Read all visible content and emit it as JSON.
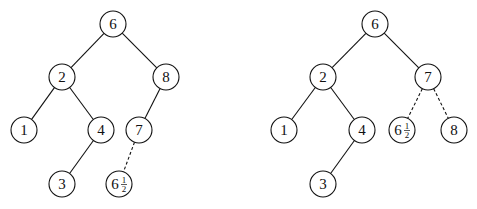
{
  "figure": {
    "trees": [
      {
        "id": "left-tree",
        "nodes": [
          {
            "id": "n6",
            "label": "6",
            "x": 113,
            "y": 24
          },
          {
            "id": "n2",
            "label": "2",
            "x": 62,
            "y": 77
          },
          {
            "id": "n8",
            "label": "8",
            "x": 166,
            "y": 77
          },
          {
            "id": "n1",
            "label": "1",
            "x": 24,
            "y": 130
          },
          {
            "id": "n4",
            "label": "4",
            "x": 101,
            "y": 130
          },
          {
            "id": "n7",
            "label": "7",
            "x": 139,
            "y": 130
          },
          {
            "id": "n3",
            "label": "3",
            "x": 62,
            "y": 184
          },
          {
            "id": "n6h",
            "label": "6",
            "fraction": {
              "num": "1",
              "den": "2"
            },
            "x": 119,
            "y": 184
          }
        ],
        "edges": [
          {
            "from": "n6",
            "to": "n2",
            "style": "solid"
          },
          {
            "from": "n6",
            "to": "n8",
            "style": "solid"
          },
          {
            "from": "n2",
            "to": "n1",
            "style": "solid"
          },
          {
            "from": "n2",
            "to": "n4",
            "style": "solid"
          },
          {
            "from": "n8",
            "to": "n7",
            "style": "solid"
          },
          {
            "from": "n4",
            "to": "n3",
            "style": "solid"
          },
          {
            "from": "n7",
            "to": "n6h",
            "style": "dashed"
          }
        ]
      },
      {
        "id": "right-tree",
        "nodes": [
          {
            "id": "m6",
            "label": "6",
            "x": 375,
            "y": 24
          },
          {
            "id": "m2",
            "label": "2",
            "x": 323,
            "y": 77
          },
          {
            "id": "m7",
            "label": "7",
            "x": 428,
            "y": 77
          },
          {
            "id": "m1",
            "label": "1",
            "x": 284,
            "y": 130
          },
          {
            "id": "m4",
            "label": "4",
            "x": 362,
            "y": 130
          },
          {
            "id": "m6h",
            "label": "6",
            "fraction": {
              "num": "1",
              "den": "2"
            },
            "x": 402,
            "y": 130
          },
          {
            "id": "m8",
            "label": "8",
            "x": 454,
            "y": 130
          },
          {
            "id": "m3",
            "label": "3",
            "x": 323,
            "y": 184
          }
        ],
        "edges": [
          {
            "from": "m6",
            "to": "m2",
            "style": "solid"
          },
          {
            "from": "m6",
            "to": "m7",
            "style": "solid"
          },
          {
            "from": "m2",
            "to": "m1",
            "style": "solid"
          },
          {
            "from": "m2",
            "to": "m4",
            "style": "solid"
          },
          {
            "from": "m4",
            "to": "m3",
            "style": "solid"
          },
          {
            "from": "m7",
            "to": "m6h",
            "style": "dashed"
          },
          {
            "from": "m7",
            "to": "m8",
            "style": "dashed"
          }
        ]
      }
    ],
    "node_radius": 13,
    "colors": {
      "stroke": "#111111",
      "fill": "#ffffff",
      "background": "#ffffff"
    }
  }
}
